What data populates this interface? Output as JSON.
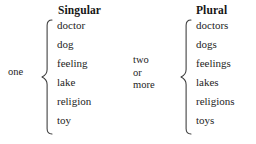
{
  "diagram": {
    "title_singular": "Singular",
    "title_plural": "Plural",
    "quantifier_singular": "one",
    "quantifier_plural_lines": [
      "two",
      "or",
      "more"
    ],
    "quantifier_plural_text": "two or more",
    "colors": {
      "background": "#ffffff",
      "text": "#242424",
      "heading": "#161616",
      "brace": "#3a3a3a"
    },
    "singular_words": [
      "doctor",
      "dog",
      "feeling",
      "lake",
      "religion",
      "toy"
    ],
    "plural_words": [
      "doctors",
      "dogs",
      "feelings",
      "lakes",
      "religions",
      "toys"
    ]
  }
}
